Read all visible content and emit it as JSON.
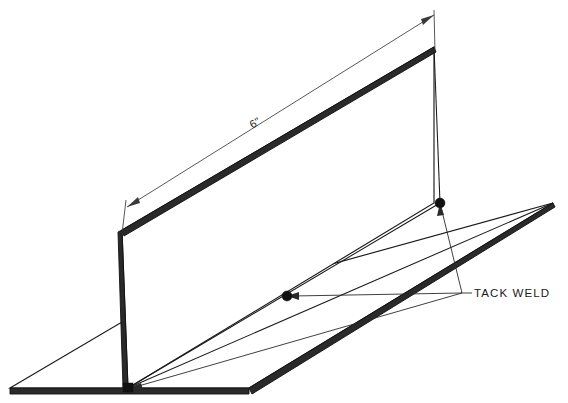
{
  "drawing": {
    "title": "Tack Weld Fixture Detail",
    "background_color": "#ffffff",
    "line_color": "#1a1a1a",
    "edge_fill_color": "#2a2a2a",
    "dimension_color": "#3a3a3a",
    "weld_marker_color": "#111111",
    "canvas": {
      "width": 568,
      "height": 403
    },
    "projection": "isometric"
  },
  "dimensions": [
    {
      "id": "length-6in",
      "label": "6\"",
      "rotation_deg": -26,
      "text_x": 257,
      "text_y": 126,
      "start_point": {
        "x": 128,
        "y": 208
      },
      "end_point": {
        "x": 434,
        "y": 14
      },
      "extension_start": {
        "x": 123,
        "y": 232
      },
      "extension_end": {
        "x": 434,
        "y": 48
      }
    }
  ],
  "callouts": [
    {
      "id": "tack-weld",
      "label": "TACK  WELD",
      "text_x": 474,
      "text_y": 297,
      "anchor_point": {
        "x": 462,
        "y": 293
      },
      "targets": [
        {
          "name": "weld-top-right",
          "x": 440,
          "y": 203
        },
        {
          "name": "weld-middle",
          "x": 287,
          "y": 296
        },
        {
          "name": "weld-bottom-left",
          "x": 128,
          "y": 388
        }
      ]
    }
  ],
  "weld_points": [
    {
      "id": "weld-top-right",
      "x": 440,
      "y": 203,
      "radius": 5.0
    },
    {
      "id": "weld-middle",
      "x": 287,
      "y": 296,
      "radius": 5.0
    },
    {
      "id": "weld-bottom-left",
      "x": 128,
      "y": 388,
      "radius": 4.6
    }
  ],
  "parts": [
    {
      "id": "vertical-plate",
      "name": "Vertical Plate",
      "face_points": "122,230 434,47 434,203 128,388",
      "top_edge_points": "122,230 434,47 436,52 124,236",
      "left_edge_points": "118,232 122,230 128,388 123,388"
    },
    {
      "id": "base-plate",
      "name": "Base Plate",
      "face_points": "10,388 122,322 553,203 249,388",
      "front_edge_points": "10,388 249,388 249,394 10,394",
      "right_edge_points": "249,388 553,203 555,207 252,394"
    }
  ]
}
